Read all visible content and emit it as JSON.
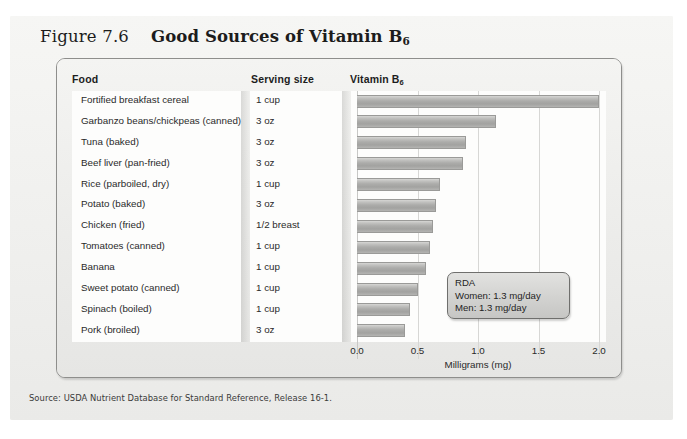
{
  "figure": {
    "number": "Figure 7.6",
    "heading_prefix": "Good Sources of Vitamin B",
    "heading_subscript": "6",
    "source": "Source: USDA Nutrient Database for Standard Reference, Release 16-1."
  },
  "table": {
    "headers": {
      "food": "Food",
      "serving": "Serving size",
      "vitamin_prefix": "Vitamin B",
      "vitamin_subscript": "6"
    }
  },
  "callout": {
    "title": "RDA",
    "women": "Women: 1.3 mg/day",
    "men": "Men: 1.3 mg/day"
  },
  "colors": {
    "bar_fill": "#acacaa",
    "bar_edge": "#9a9a98",
    "card_bg": "#eeeeec",
    "plot_bg": "#fdfdfc",
    "page_bg": "#f2f2f0",
    "gridline": "#d7d7d5",
    "text": "#2a2a2a"
  },
  "chart_data": {
    "type": "bar",
    "orientation": "horizontal",
    "title": "Good Sources of Vitamin B6",
    "xlabel": "Milligrams (mg)",
    "ylabel": "",
    "xlim": [
      0.0,
      2.0
    ],
    "xticks": [
      "0.0",
      "0.5",
      "1.0",
      "1.5",
      "2.0"
    ],
    "xtick_values": [
      0.0,
      0.5,
      1.0,
      1.5,
      2.0
    ],
    "grid": true,
    "legend": "none",
    "categories": [
      "Fortified breakfast cereal",
      "Garbanzo beans/chickpeas (canned)",
      "Tuna (baked)",
      "Beef liver (pan-fried)",
      "Rice (parboiled, dry)",
      "Potato (baked)",
      "Chicken (fried)",
      "Tomatoes (canned)",
      "Banana",
      "Sweet potato (canned)",
      "Spinach (boiled)",
      "Pork (broiled)"
    ],
    "serving_sizes": [
      "1 cup",
      "3 oz",
      "3 oz",
      "3 oz",
      "1 cup",
      "3 oz",
      "1/2 breast",
      "1 cup",
      "1 cup",
      "1 cup",
      "1 cup",
      "3 oz"
    ],
    "values": [
      2.0,
      1.15,
      0.9,
      0.88,
      0.69,
      0.65,
      0.63,
      0.6,
      0.57,
      0.5,
      0.44,
      0.4
    ],
    "units": "mg",
    "annotations": [
      "RDA",
      "Women: 1.3 mg/day",
      "Men: 1.3 mg/day"
    ]
  }
}
